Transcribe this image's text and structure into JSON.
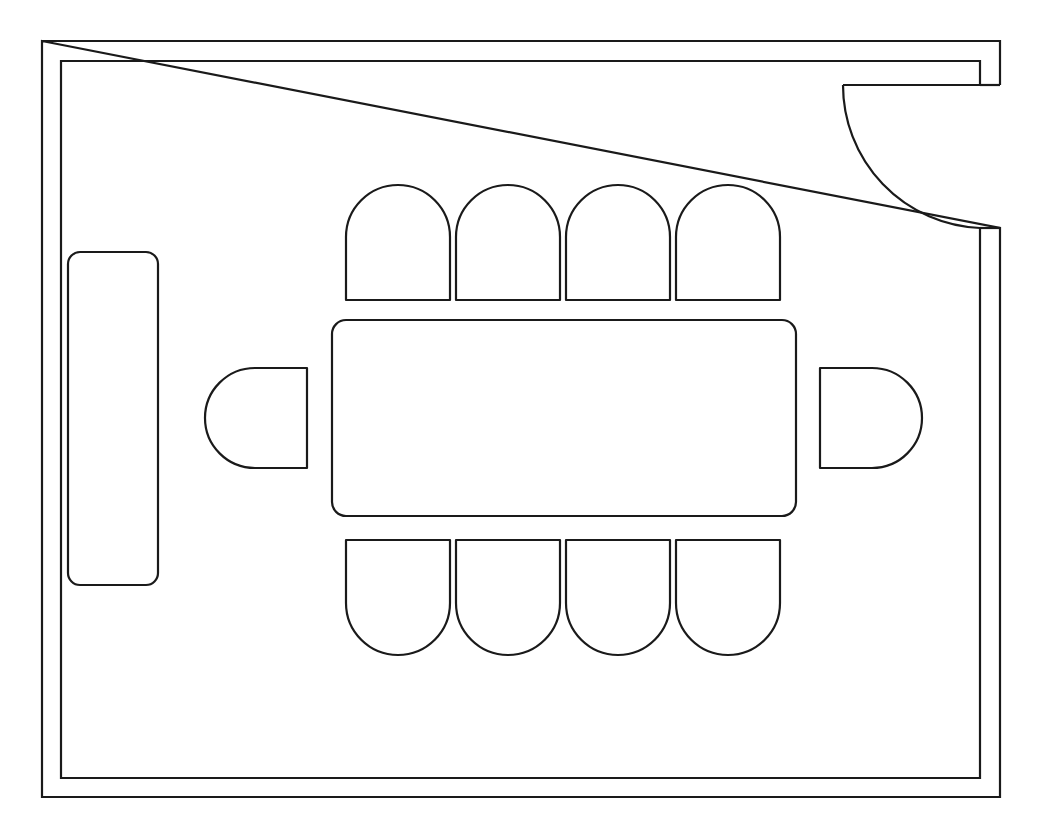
{
  "document": {
    "kind": "architectural-floor-plan",
    "title": "Conference Room Floor Plan",
    "description": "Rectangular conference room drawn in plan view with a double-line wall outline, a single hinged door in the upper right corner, a long rectangular conference table centered in the room, ten seats arranged around the table, and a credenza against the left wall.",
    "line_color": "#1a1a1a",
    "fill_color": "#ffffff",
    "background_color": "#ffffff",
    "line_width": 2.2,
    "canvas": {
      "width": 1050,
      "height": 828
    }
  },
  "room": {
    "name": "conference-room",
    "outer_wall": {
      "x": 42,
      "y": 41,
      "width": 958,
      "height": 756
    },
    "inner_wall": {
      "x": 61,
      "y": 61,
      "width": 919,
      "height": 717
    },
    "wall_thickness": 19
  },
  "door": {
    "name": "hinged-door",
    "label": "Door",
    "position": "top-right-corner",
    "swing": "inward-counterclockwise",
    "hinge": {
      "x": 843,
      "y": 228
    },
    "leaf_start": {
      "x": 843,
      "y": 85
    },
    "leaf_end": {
      "x": 980,
      "y": 228
    },
    "radius": 143,
    "opening_width": 143
  },
  "table": {
    "name": "conference-table",
    "label": "Conference Table",
    "shape": "rounded-rectangle",
    "x": 332,
    "y": 320,
    "width": 464,
    "height": 196,
    "corner_radius": 14
  },
  "credenza": {
    "name": "credenza",
    "label": "Credenza",
    "shape": "rounded-rectangle",
    "x": 68,
    "y": 252,
    "width": 90,
    "height": 333,
    "corner_radius": 12
  },
  "seating": {
    "total_count": 10,
    "top_row": {
      "label": "Top Row Chairs",
      "count": 4,
      "orientation": "arch-up",
      "chair_width": 104,
      "chair_height": 115,
      "corner_radius": 52,
      "y": 185,
      "x_positions": [
        346,
        456,
        566,
        676
      ]
    },
    "bottom_row": {
      "label": "Bottom Row Chairs",
      "count": 4,
      "orientation": "arch-down",
      "chair_width": 104,
      "chair_height": 115,
      "corner_radius": 52,
      "y": 540,
      "x_positions": [
        346,
        456,
        566,
        676
      ]
    },
    "left_end": {
      "label": "Left End Chair",
      "count": 1,
      "orientation": "arch-left",
      "chair_width": 102,
      "chair_height": 100,
      "corner_radius": 50,
      "x": 205,
      "y": 368
    },
    "right_end": {
      "label": "Right End Chair",
      "count": 1,
      "orientation": "arch-right",
      "chair_width": 102,
      "chair_height": 100,
      "corner_radius": 50,
      "x": 820,
      "y": 368
    }
  }
}
